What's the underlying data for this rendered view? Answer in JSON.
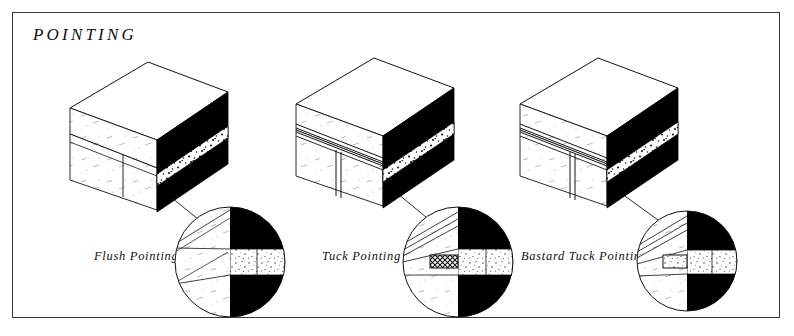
{
  "plate": {
    "title": "POINTING",
    "background_color": "#ffffff",
    "border_color": "#3a3a3a",
    "ink_color": "#111111",
    "black_fill": "#000000",
    "brick_face_color": "#ffffff"
  },
  "figures": [
    {
      "id": "flush-pointing",
      "label": "Flush Pointing",
      "block": {
        "origin_x": 70,
        "top_y": 62,
        "description": "isometric brick wall block, flush mortar joint"
      },
      "detail": {
        "center_x": 230,
        "center_y": 262,
        "radius": 55,
        "joint_style": "flush",
        "ridge": false
      }
    },
    {
      "id": "tuck-pointing",
      "label": "Tuck Pointing",
      "block": {
        "origin_x": 296,
        "top_y": 58,
        "description": "isometric brick wall block with raised tuck ridge"
      },
      "detail": {
        "center_x": 458,
        "center_y": 262,
        "radius": 55,
        "joint_style": "tuck",
        "ridge": true,
        "ridge_fill": "cross-hatch"
      }
    },
    {
      "id": "bastard-tuck-pointing",
      "label": "Bastard Tuck Pointing",
      "block": {
        "origin_x": 520,
        "top_y": 58,
        "description": "isometric brick wall block with mortar-formed ridge"
      },
      "detail": {
        "center_x": 687,
        "center_y": 261,
        "radius": 50,
        "joint_style": "bastard-tuck",
        "ridge": true,
        "ridge_fill": "stipple"
      }
    }
  ]
}
